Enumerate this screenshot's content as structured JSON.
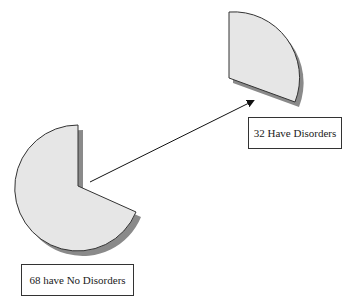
{
  "diagram": {
    "type": "exploded-pie",
    "slices": [
      {
        "label": "68 have No Disorders",
        "value": 68,
        "fill": "#e6e6e6"
      },
      {
        "label": "32 Have Disorders",
        "value": 32,
        "fill": "#e6e6e6"
      }
    ],
    "arrow": {
      "from": "68 have No Disorders",
      "to": "32 Have Disorders"
    },
    "colors": {
      "slice_fill": "#e6e6e6",
      "shadow": "#8a8a8a",
      "outline": "#333333"
    }
  },
  "labels": {
    "no_disorders": "68 have No Disorders",
    "have_disorders": "32 Have Disorders"
  }
}
